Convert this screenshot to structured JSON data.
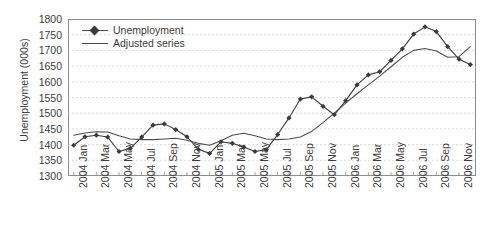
{
  "chart_data": {
    "type": "line",
    "title": "",
    "xlabel": "",
    "ylabel": "Unemployment (000s)",
    "ylim": [
      1300,
      1800
    ],
    "ytick_step": 50,
    "yticks": [
      1800,
      1750,
      1700,
      1650,
      1600,
      1550,
      1500,
      1450,
      1400,
      1350,
      1300
    ],
    "grid": true,
    "grid_axis": "y",
    "legend_position": "top-left",
    "categories": [
      "2004 Jan",
      "2004 Feb",
      "2004 Mar",
      "2004 Apr",
      "2004 May",
      "2004 Jun",
      "2004 Jul",
      "2004 Aug",
      "2004 Sep",
      "2004 Oct",
      "2004 Nov",
      "2004 Dec",
      "2005 Jan",
      "2005 Feb",
      "2005 Mar",
      "2005 Apr",
      "2005 May",
      "2005 Jun",
      "2005 Jul",
      "2005 Aug",
      "2005 Sep",
      "2005 Oct",
      "2005 Nov",
      "2005 Dec",
      "2006 Jan",
      "2006 Feb",
      "2006 Mar",
      "2006 Apr",
      "2006 May",
      "2006 Jun",
      "2006 Jul",
      "2006 Aug",
      "2006 Sep",
      "2006 Oct",
      "2006 Nov",
      "2006 Dec"
    ],
    "xtick_labels": [
      "2004 Jan",
      "2004 Mar",
      "2004 May",
      "2004 Jul",
      "2004 Sep",
      "2004 Nov",
      "2005 Jan",
      "2005 Mar",
      "2005 May",
      "2005 Jul",
      "2005 Sep",
      "2005 Nov",
      "2006 Jan",
      "2006 Mar",
      "2006 May",
      "2006 Jul",
      "2006 Sep",
      "2006 Nov"
    ],
    "series": [
      {
        "name": "Unemployment",
        "marker": "diamond",
        "color": "#3b3b3b",
        "values": [
          1398,
          1425,
          1430,
          1424,
          1378,
          1388,
          1424,
          1462,
          1466,
          1448,
          1425,
          1385,
          1372,
          1409,
          1404,
          1392,
          1378,
          1384,
          1432,
          1485,
          1545,
          1552,
          1522,
          1495,
          1540,
          1590,
          1622,
          1632,
          1668,
          1705,
          1752,
          1775,
          1760,
          1712,
          1672,
          1655
        ]
      },
      {
        "name": "Adjusted series",
        "marker": "none",
        "color": "#4d4d4d",
        "values": [
          1430,
          1437,
          1441,
          1440,
          1428,
          1418,
          1416,
          1416,
          1418,
          1420,
          1414,
          1404,
          1398,
          1412,
          1430,
          1436,
          1428,
          1418,
          1416,
          1418,
          1424,
          1442,
          1470,
          1500,
          1532,
          1562,
          1590,
          1618,
          1648,
          1678,
          1700,
          1706,
          1698,
          1678,
          1680,
          1712
        ]
      }
    ]
  },
  "legend": {
    "items": [
      {
        "label": "Unemployment",
        "key": "line-with-diamond-marker"
      },
      {
        "label": "Adjusted series",
        "key": "plain-line"
      }
    ]
  },
  "axes": {
    "y_title": "Unemployment (000s)"
  },
  "colors": {
    "series_primary": "#3b3b3b",
    "series_secondary": "#4d4d4d",
    "frame": "#8d8d8d",
    "grid": "#c9c9c9",
    "text": "#3c3c3c",
    "background": "#ffffff"
  }
}
